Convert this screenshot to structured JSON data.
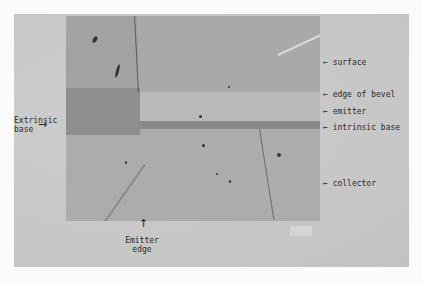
{
  "figure": {
    "type": "cross-section micrograph of bevelled transistor",
    "colors": {
      "page_background": "#fbfbfb",
      "plate_background": "#c9c9c9",
      "micrograph_base": "#ababab",
      "extrinsic_base_region": "#8e8e8e",
      "intrinsic_base_band": "#8a8a8a",
      "text": "#2a2a2a"
    },
    "labels": {
      "surface": "surface",
      "edge_of_bevel": "edge of bevel",
      "emitter": "emitter",
      "intrinsic_base": "intrinsic base",
      "collector": "collector",
      "extrinsic_base_line1": "Extrinsic",
      "extrinsic_base_line2": "base",
      "emitter_edge_line1": "Emitter",
      "emitter_edge_line2": "edge"
    },
    "arrows": {
      "left_arrow": "←",
      "right_arrow": "→",
      "up_arrow": "↑"
    }
  }
}
